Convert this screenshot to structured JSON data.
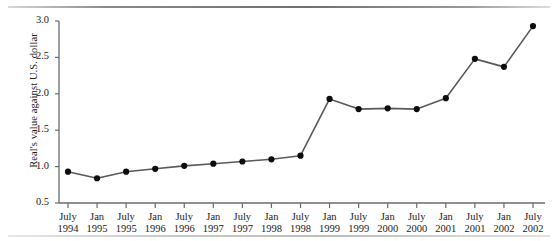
{
  "chart_data": {
    "type": "line",
    "title": "",
    "xlabel": "",
    "ylabel": "Real's value against U.S. dollar",
    "ylim": [
      0.5,
      3.0
    ],
    "yticks": [
      "0.5",
      "1.0",
      "1.5",
      "2.0",
      "2.5",
      "3.0"
    ],
    "grid": false,
    "legend": "none",
    "categories": [
      "July 1994",
      "Jan 1995",
      "July 1995",
      "Jan 1996",
      "July 1996",
      "Jan 1997",
      "July 1997",
      "Jan 1998",
      "July 1998",
      "Jan 1999",
      "July 1999",
      "Jan 2000",
      "July 2000",
      "Jan 2001",
      "July 2001",
      "Jan 2002",
      "July 2002"
    ],
    "xtick_labels": [
      {
        "month": "July",
        "year": "1994"
      },
      {
        "month": "Jan",
        "year": "1995"
      },
      {
        "month": "July",
        "year": "1995"
      },
      {
        "month": "Jan",
        "year": "1996"
      },
      {
        "month": "July",
        "year": "1996"
      },
      {
        "month": "Jan",
        "year": "1997"
      },
      {
        "month": "July",
        "year": "1997"
      },
      {
        "month": "Jan",
        "year": "1998"
      },
      {
        "month": "July",
        "year": "1998"
      },
      {
        "month": "Jan",
        "year": "1999"
      },
      {
        "month": "July",
        "year": "1999"
      },
      {
        "month": "Jan",
        "year": "2000"
      },
      {
        "month": "July",
        "year": "2000"
      },
      {
        "month": "Jan",
        "year": "2001"
      },
      {
        "month": "July",
        "year": "2001"
      },
      {
        "month": "Jan",
        "year": "2002"
      },
      {
        "month": "July",
        "year": "2002"
      }
    ],
    "values": [
      0.93,
      0.84,
      0.93,
      0.97,
      1.01,
      1.04,
      1.07,
      1.1,
      1.15,
      1.93,
      1.79,
      1.8,
      1.79,
      1.94,
      2.48,
      2.37,
      2.93
    ],
    "series": [
      {
        "name": "Real's value against U.S. dollar",
        "values": [
          0.93,
          0.84,
          0.93,
          0.97,
          1.01,
          1.04,
          1.07,
          1.1,
          1.15,
          1.93,
          1.79,
          1.8,
          1.79,
          1.94,
          2.48,
          2.37,
          2.93
        ]
      }
    ],
    "colors": {
      "line": "#595959",
      "marker": "#0d0d0d",
      "axis": "#6b6b6b",
      "text": "#1a1a1a"
    }
  }
}
